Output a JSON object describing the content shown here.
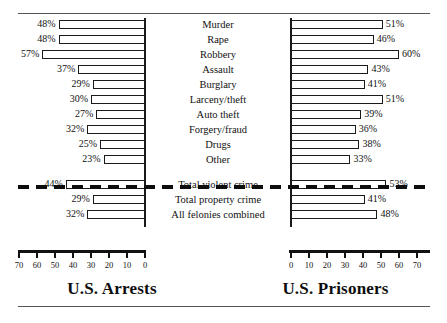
{
  "chart_data": {
    "type": "bar",
    "title": "",
    "subtitle": "",
    "orientation": "horizontal",
    "layout": "back-to-back population pyramid",
    "grid": false,
    "legend_position": "none",
    "xlabel": "",
    "ylabel": "",
    "xlim_left": [
      70,
      0
    ],
    "xlim_right": [
      0,
      70
    ],
    "axis_unit": "percent",
    "tick_labels_left": [
      "70",
      "60",
      "50",
      "40",
      "30",
      "20",
      "10",
      "0"
    ],
    "tick_labels_right": [
      "0",
      "10",
      "20",
      "30",
      "40",
      "50",
      "60",
      "70"
    ],
    "tick_values": [
      0,
      10,
      20,
      30,
      40,
      50,
      60,
      70
    ],
    "categories": [
      "Murder",
      "Rape",
      "Robbery",
      "Assault",
      "Burglary",
      "Larceny/theft",
      "Auto theft",
      "Forgery/fraud",
      "Drugs",
      "Other",
      "Total violent crime",
      "Total property crime",
      "All felonies combined"
    ],
    "separator_after_index": 9,
    "series": [
      {
        "name": "U.S. Arrests",
        "side": "left",
        "values": [
          48,
          48,
          57,
          37,
          29,
          30,
          27,
          32,
          25,
          23,
          44,
          29,
          32
        ],
        "value_labels": [
          "48%",
          "48%",
          "57%",
          "37%",
          "29%",
          "30%",
          "27%",
          "32%",
          "25%",
          "23%",
          "44%",
          "29%",
          "32%"
        ]
      },
      {
        "name": "U.S. Prisoners",
        "side": "right",
        "values": [
          51,
          46,
          60,
          43,
          41,
          51,
          39,
          36,
          38,
          33,
          53,
          41,
          48
        ],
        "value_labels": [
          "51%",
          "46%",
          "60%",
          "43%",
          "41%",
          "51%",
          "39%",
          "36%",
          "38%",
          "33%",
          "53%",
          "41%",
          "48%"
        ]
      }
    ]
  },
  "captions": {
    "left": "U.S. Arrests",
    "right": "U.S. Prisoners"
  },
  "colors": {
    "bar_fill": "#ffffff",
    "bar_stroke": "#1a1a1a",
    "axis": "#111111",
    "rule": "#555555",
    "text": "#111111"
  }
}
